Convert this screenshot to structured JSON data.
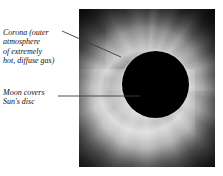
{
  "figure": {
    "title": "TOTAL SOLAR ECLIPSE",
    "title_note": "bold serif heading, cropped at top edge of screenshot",
    "photo": {
      "name": "total-solar-eclipse-photograph",
      "description": "Black-and-white photograph of a total solar eclipse showing the dark lunar disc surrounded by the bright radiating solar corona",
      "frame": {
        "x": 79,
        "y": 9,
        "width": 136,
        "height": 158
      },
      "moon_disc": {
        "center_x": 155,
        "center_y": 84,
        "radius": 33
      },
      "colors": {
        "disc": "#000000",
        "corona_bright": "#e8e8e8",
        "corona_mid": "#8e8e8e",
        "sky_dark": "#0d0d0d",
        "page_background": "#ffffff"
      }
    },
    "annotations": [
      {
        "id": "corona",
        "label": "Corona (outer\natmosphere\nof extremely\nhot, diffuse gas)",
        "leader": {
          "x1": 62,
          "y1": 31,
          "x2": 121,
          "y2": 57
        }
      },
      {
        "id": "moon",
        "label": "Moon covers\nSun's disc",
        "leader": {
          "x1": 58,
          "y1": 96,
          "x2": 140,
          "y2": 96
        }
      }
    ],
    "leader_line_color": "#3c3c3c"
  }
}
